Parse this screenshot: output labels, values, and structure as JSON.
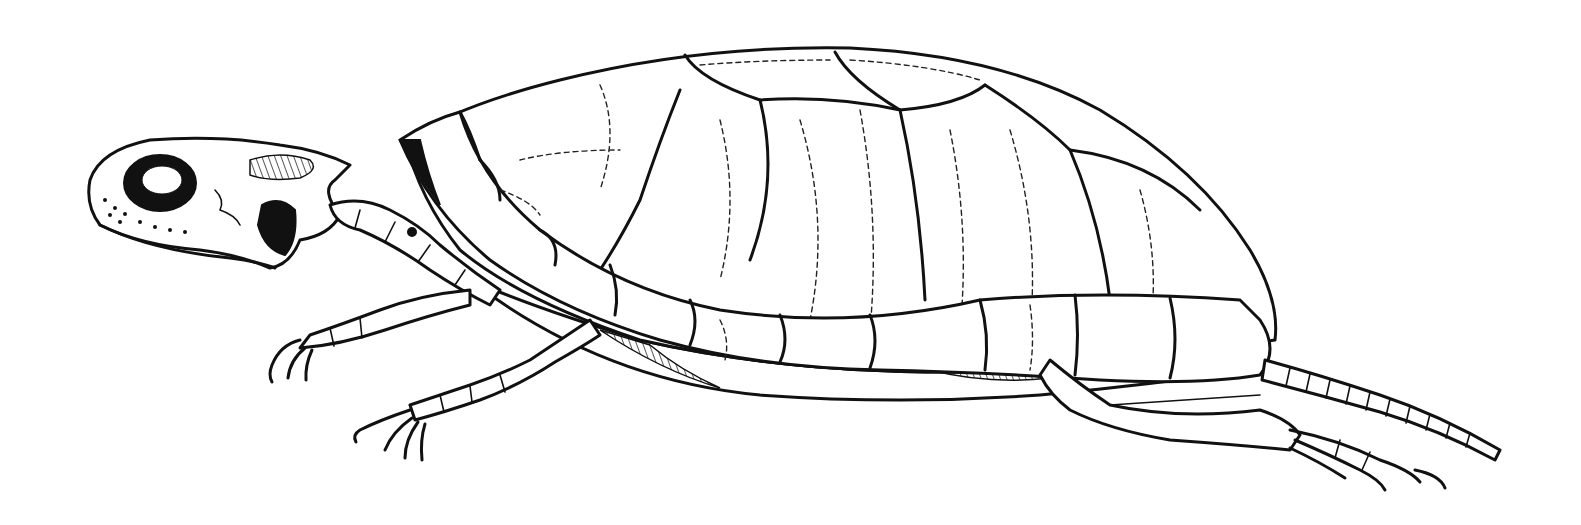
{
  "image": {
    "subject": "turtle skeleton illustration",
    "style": "black and white line engraving",
    "width": 1581,
    "height": 525,
    "colors": {
      "background": "#ffffff",
      "ink": "#111111"
    },
    "parts": [
      {
        "name": "skull",
        "label": ""
      },
      {
        "name": "cervical-vertebrae",
        "label": ""
      },
      {
        "name": "carapace",
        "label": ""
      },
      {
        "name": "marginal-scutes",
        "label": ""
      },
      {
        "name": "forelimbs",
        "label": ""
      },
      {
        "name": "hindlimb",
        "label": ""
      },
      {
        "name": "tail-vertebrae",
        "label": ""
      }
    ]
  }
}
